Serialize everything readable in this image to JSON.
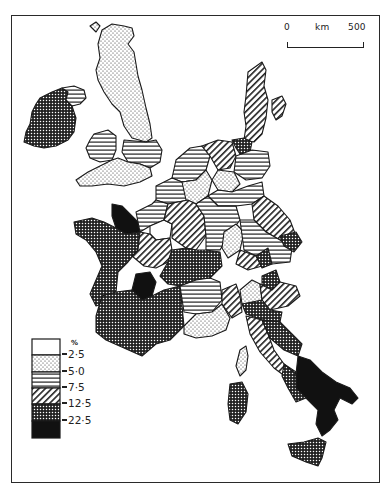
{
  "map": {
    "title": "",
    "region": "Western Europe",
    "scale_bar": {
      "start_label": "0",
      "unit_label": "km",
      "end_label": "500"
    },
    "legend": {
      "unit": "%",
      "classes": [
        {
          "pattern": "blank",
          "range": "0 - 2.5"
        },
        {
          "pattern": "dots",
          "range": "2.5 - 5.0"
        },
        {
          "pattern": "horizontal-lines",
          "range": "5.0 - 7.5"
        },
        {
          "pattern": "diagonal-lines",
          "range": "7.5 - 12.5"
        },
        {
          "pattern": "crosshatch",
          "range": "12.5 - 22.5"
        },
        {
          "pattern": "solid-black",
          "range": "> 22.5"
        }
      ],
      "breaks": [
        "2·5",
        "5·0",
        "7·5",
        "12·5",
        "22·5"
      ]
    },
    "colors": {
      "ink": "#1a1a1a",
      "paper": "#ffffff"
    }
  }
}
